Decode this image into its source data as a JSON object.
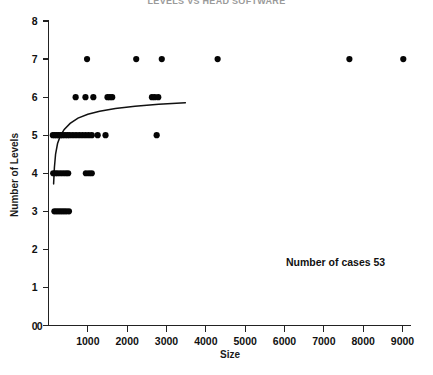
{
  "title": "LEVELS VS HEAD SOFTWARE",
  "annotation": {
    "cases_label": "Number of cases  53"
  },
  "axes": {
    "x": {
      "label": "Size",
      "ticks": [
        0,
        1000,
        2000,
        3000,
        4000,
        5000,
        6000,
        7000,
        8000,
        9000
      ],
      "tick_labels": [
        "0",
        "1000",
        "2000",
        "3000",
        "4000",
        "5000",
        "6000",
        "7000",
        "8000",
        "9000"
      ],
      "min": 0,
      "max": 9200
    },
    "y": {
      "label": "Number of Levels",
      "ticks": [
        0,
        1,
        2,
        3,
        4,
        5,
        6,
        7,
        8
      ],
      "tick_labels": [
        "0",
        "1",
        "2",
        "3",
        "4",
        "5",
        "6",
        "7",
        "8"
      ],
      "min": 0,
      "max": 8
    }
  },
  "colors": {
    "marker": "#050505",
    "axis": "#222222",
    "curve": "#111111",
    "background": "#ffffff"
  },
  "chart_data": {
    "type": "scatter",
    "title": "LEVELS VS HEAD SOFTWARE",
    "xlabel": "Size",
    "ylabel": "Number of Levels",
    "xlim": [
      0,
      9200
    ],
    "ylim": [
      0,
      8
    ],
    "grid": false,
    "legend": null,
    "n_cases": 53,
    "annotations": [
      {
        "text": "Number of cases  53",
        "x": 6000,
        "y": 1.55
      }
    ],
    "series": [
      {
        "name": "cases",
        "marker": "filled-circle",
        "points": [
          [
            150,
            3
          ],
          [
            210,
            3
          ],
          [
            270,
            3
          ],
          [
            330,
            3
          ],
          [
            390,
            3
          ],
          [
            450,
            3
          ],
          [
            520,
            3
          ],
          [
            120,
            4
          ],
          [
            170,
            4
          ],
          [
            230,
            4
          ],
          [
            300,
            4
          ],
          [
            370,
            4
          ],
          [
            440,
            4
          ],
          [
            500,
            4
          ],
          [
            950,
            4
          ],
          [
            1030,
            4
          ],
          [
            1100,
            4
          ],
          [
            110,
            5
          ],
          [
            160,
            5
          ],
          [
            210,
            5
          ],
          [
            260,
            5
          ],
          [
            310,
            5
          ],
          [
            360,
            5
          ],
          [
            420,
            5
          ],
          [
            480,
            5
          ],
          [
            540,
            5
          ],
          [
            620,
            5
          ],
          [
            700,
            5
          ],
          [
            780,
            5
          ],
          [
            860,
            5
          ],
          [
            940,
            5
          ],
          [
            1020,
            5
          ],
          [
            1100,
            5
          ],
          [
            1250,
            5
          ],
          [
            1450,
            5
          ],
          [
            2750,
            5
          ],
          [
            690,
            6
          ],
          [
            940,
            6
          ],
          [
            1140,
            6
          ],
          [
            1500,
            6
          ],
          [
            1560,
            6
          ],
          [
            1620,
            6
          ],
          [
            2630,
            6
          ],
          [
            2700,
            6
          ],
          [
            2790,
            6
          ],
          [
            980,
            7
          ],
          [
            2230,
            7
          ],
          [
            2880,
            7
          ],
          [
            4300,
            7
          ],
          [
            7650,
            7
          ],
          [
            9020,
            7
          ]
        ]
      }
    ],
    "fit_curve": {
      "type": "logarithmic-fit",
      "x_start": 130,
      "x_end": 3480,
      "y_start": 3.72,
      "y_end": 5.85,
      "points": [
        [
          130,
          3.72
        ],
        [
          150,
          4.15
        ],
        [
          180,
          4.5
        ],
        [
          230,
          4.78
        ],
        [
          300,
          4.98
        ],
        [
          400,
          5.15
        ],
        [
          550,
          5.31
        ],
        [
          750,
          5.45
        ],
        [
          1000,
          5.55
        ],
        [
          1300,
          5.63
        ],
        [
          1700,
          5.7
        ],
        [
          2200,
          5.76
        ],
        [
          2800,
          5.81
        ],
        [
          3480,
          5.85
        ]
      ]
    }
  }
}
